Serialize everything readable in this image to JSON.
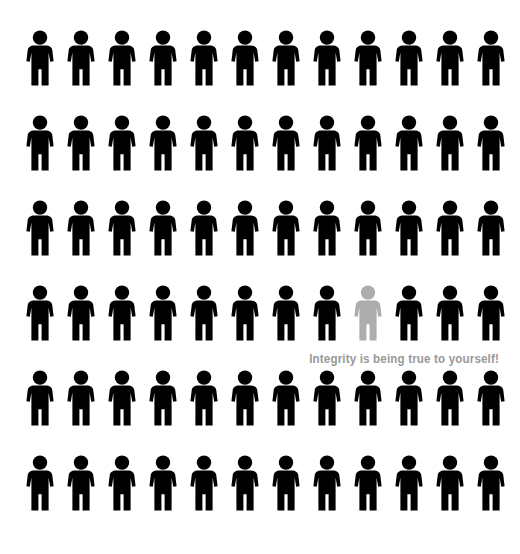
{
  "canvas": {
    "width": 520,
    "height": 554,
    "background_color": "#ffffff"
  },
  "caption": {
    "text": "Integrity is being true to yourself!",
    "color": "#999999",
    "align": "right"
  },
  "pictogram": {
    "icon_name": "person-figure-icon",
    "total_figures": 72,
    "rows": 6,
    "columns": 12,
    "default_color": "#000000",
    "highlight_color": "#ADADAD",
    "highlighted": {
      "row": 4,
      "column": 9
    },
    "layout": {
      "first_column_x": 25,
      "column_pitch": 41,
      "first_row_y": 30,
      "row_pitch": 85,
      "figure_width": 30,
      "figure_height": 56
    },
    "grid": [
      [
        "#000000",
        "#000000",
        "#000000",
        "#000000",
        "#000000",
        "#000000",
        "#000000",
        "#000000",
        "#000000",
        "#000000",
        "#000000",
        "#000000"
      ],
      [
        "#000000",
        "#000000",
        "#000000",
        "#000000",
        "#000000",
        "#000000",
        "#000000",
        "#000000",
        "#000000",
        "#000000",
        "#000000",
        "#000000"
      ],
      [
        "#000000",
        "#000000",
        "#000000",
        "#000000",
        "#000000",
        "#000000",
        "#000000",
        "#000000",
        "#000000",
        "#000000",
        "#000000",
        "#000000"
      ],
      [
        "#000000",
        "#000000",
        "#000000",
        "#000000",
        "#000000",
        "#000000",
        "#000000",
        "#000000",
        "#ADADAD",
        "#000000",
        "#000000",
        "#000000"
      ],
      [
        "#000000",
        "#000000",
        "#000000",
        "#000000",
        "#000000",
        "#000000",
        "#000000",
        "#000000",
        "#000000",
        "#000000",
        "#000000",
        "#000000"
      ],
      [
        "#000000",
        "#000000",
        "#000000",
        "#000000",
        "#000000",
        "#000000",
        "#000000",
        "#000000",
        "#000000",
        "#000000",
        "#000000",
        "#000000"
      ]
    ]
  }
}
